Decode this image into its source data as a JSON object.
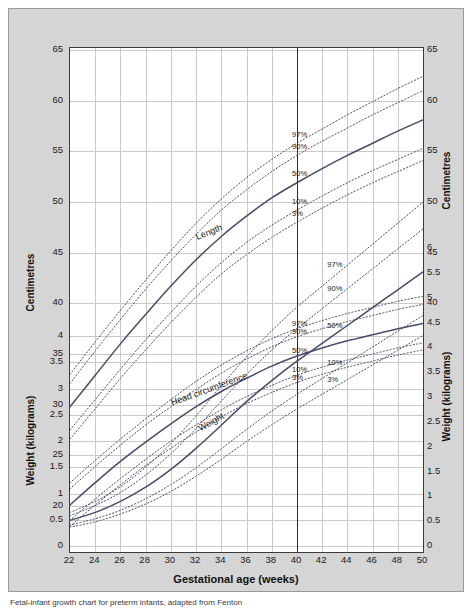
{
  "figure": {
    "caption": "Fetal-infant growth chart for preterm infants, adapted from Fenton",
    "background_color": "#d5d5d5",
    "plot_background": "#ffffff",
    "reference_line_color": "#2b2b2b",
    "grid_color": "#c9c9c9",
    "curve_color": "#4a4a6a"
  },
  "chart_data": {
    "type": "line",
    "title": "",
    "xlabel": "Gestational age (weeks)",
    "xlim": [
      22,
      50
    ],
    "xticks": [
      22,
      24,
      26,
      28,
      30,
      32,
      34,
      36,
      38,
      40,
      42,
      44,
      46,
      48,
      50
    ],
    "grid": true,
    "legend_position": "inline-annotations",
    "annotations": [
      {
        "text": "Length",
        "x": 33.5,
        "panel": "length"
      },
      {
        "text": "Head circumference",
        "x": 33.5,
        "panel": "head"
      },
      {
        "text": "Weight",
        "x": 33.5,
        "panel": "weight"
      },
      {
        "text": "40",
        "x": 40,
        "note": "term reference line"
      }
    ],
    "axes": [
      {
        "id": "left-centimetres",
        "side": "left",
        "label": "Centimetres",
        "unit": "cm",
        "ticks": [
          20,
          25,
          30,
          35,
          40,
          45,
          50,
          55,
          60,
          65
        ]
      },
      {
        "id": "left-kilograms",
        "side": "left",
        "label": "Weight (kilograms)",
        "unit": "kg",
        "ticks": [
          0,
          0.5,
          1,
          1.5,
          2,
          2.5,
          3,
          3.5,
          4
        ]
      },
      {
        "id": "right-centimetres",
        "side": "right",
        "label": "Centimetres",
        "unit": "cm",
        "ticks": [
          40,
          45,
          50,
          55,
          60,
          65
        ]
      },
      {
        "id": "right-kilograms",
        "side": "right",
        "label": "Weight (kilograms)",
        "unit": "kg",
        "ticks": [
          0,
          0.5,
          1,
          1.5,
          2,
          2.5,
          3,
          3.5,
          4,
          4.5,
          5,
          5.5,
          6
        ]
      }
    ],
    "percentile_labels": [
      "97%",
      "90%",
      "50%",
      "10%",
      "3%"
    ],
    "panels": [
      {
        "name": "length",
        "measure": "Length",
        "unit": "cm",
        "axis": "left-centimetres",
        "x": [
          22,
          24,
          26,
          28,
          30,
          32,
          34,
          36,
          38,
          40,
          42,
          44,
          46,
          48,
          50
        ],
        "series": [
          {
            "name": "97%",
            "values": [
              33.0,
              36.2,
              39.3,
              42.3,
              45.2,
              47.9,
              50.3,
              52.4,
              54.2,
              55.8,
              57.2,
              58.6,
              59.9,
              61.2,
              62.4
            ]
          },
          {
            "name": "90%",
            "values": [
              32.1,
              35.3,
              38.4,
              41.4,
              44.2,
              46.8,
              49.2,
              51.2,
              53.0,
              54.6,
              56.0,
              57.3,
              58.6,
              59.8,
              61.0
            ]
          },
          {
            "name": "50%",
            "values": [
              29.8,
              32.9,
              36.0,
              38.9,
              41.7,
              44.3,
              46.6,
              48.6,
              50.4,
              51.9,
              53.3,
              54.6,
              55.8,
              57.0,
              58.1
            ]
          },
          {
            "name": "10%",
            "values": [
              27.5,
              30.5,
              33.5,
              36.4,
              39.1,
              41.7,
              44.0,
              46.0,
              47.7,
              49.2,
              50.6,
              51.9,
              53.1,
              54.2,
              55.3
            ]
          },
          {
            "name": "3%",
            "values": [
              26.6,
              29.6,
              32.6,
              35.4,
              38.1,
              40.6,
              42.9,
              44.8,
              46.5,
              48.0,
              49.4,
              50.7,
              51.9,
              53.0,
              54.1
            ]
          }
        ]
      },
      {
        "name": "head",
        "measure": "Head circumference",
        "unit": "cm",
        "axis": "left-centimetres",
        "x": [
          22,
          24,
          26,
          28,
          30,
          32,
          34,
          36,
          38,
          40,
          42,
          44,
          46,
          48,
          50
        ],
        "series": [
          {
            "name": "97%",
            "values": [
              22.3,
              24.5,
              26.6,
              28.6,
              30.5,
              32.3,
              33.9,
              35.3,
              36.5,
              37.5,
              38.3,
              39.0,
              39.6,
              40.2,
              40.7
            ]
          },
          {
            "name": "90%",
            "values": [
              21.7,
              23.9,
              26.0,
              28.0,
              29.8,
              31.5,
              33.1,
              34.5,
              35.7,
              36.7,
              37.5,
              38.2,
              38.8,
              39.4,
              39.9
            ]
          },
          {
            "name": "50%",
            "values": [
              20.1,
              22.3,
              24.4,
              26.3,
              28.1,
              29.8,
              31.3,
              32.6,
              33.8,
              34.8,
              35.6,
              36.3,
              36.9,
              37.5,
              38.0
            ]
          },
          {
            "name": "10%",
            "values": [
              18.6,
              20.7,
              22.7,
              24.6,
              26.4,
              28.0,
              29.5,
              30.8,
              31.9,
              32.9,
              33.7,
              34.4,
              35.0,
              35.6,
              36.1
            ]
          },
          {
            "name": "3%",
            "values": [
              18.0,
              20.1,
              22.1,
              24.0,
              25.7,
              27.3,
              28.8,
              30.1,
              31.2,
              32.2,
              33.0,
              33.7,
              34.3,
              34.9,
              35.4
            ]
          }
        ]
      },
      {
        "name": "weight",
        "measure": "Weight",
        "unit": "kg",
        "axis": "left-kilograms",
        "x": [
          22,
          24,
          26,
          28,
          30,
          32,
          34,
          36,
          38,
          40,
          42,
          44,
          46,
          48,
          50
        ],
        "series": [
          {
            "name": "97%",
            "values": [
              0.64,
              0.85,
              1.13,
              1.5,
              1.95,
              2.48,
              3.05,
              3.6,
              4.1,
              4.55,
              4.95,
              5.35,
              5.75,
              6.15,
              6.55
            ]
          },
          {
            "name": "90%",
            "values": [
              0.58,
              0.77,
              1.02,
              1.35,
              1.76,
              2.24,
              2.76,
              3.27,
              3.73,
              4.14,
              4.52,
              4.9,
              5.28,
              5.66,
              6.04
            ]
          },
          {
            "name": "50%",
            "values": [
              0.49,
              0.64,
              0.85,
              1.12,
              1.46,
              1.86,
              2.3,
              2.75,
              3.15,
              3.52,
              3.86,
              4.2,
              4.54,
              4.88,
              5.22
            ]
          },
          {
            "name": "10%",
            "values": [
              0.4,
              0.52,
              0.68,
              0.9,
              1.17,
              1.49,
              1.85,
              2.22,
              2.57,
              2.89,
              3.19,
              3.49,
              3.79,
              4.09,
              4.39
            ]
          },
          {
            "name": "3%",
            "values": [
              0.36,
              0.46,
              0.61,
              0.8,
              1.04,
              1.33,
              1.65,
              1.99,
              2.31,
              2.61,
              2.89,
              3.17,
              3.45,
              3.73,
              4.01
            ]
          }
        ]
      }
    ]
  }
}
